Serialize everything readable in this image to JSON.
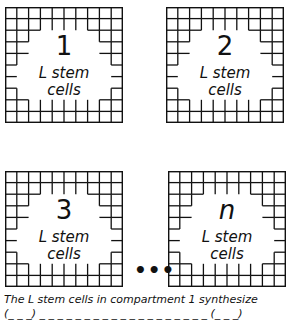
{
  "diagram": {
    "compartments": [
      {
        "number": "1",
        "line1": "L stem",
        "line2": "cells"
      },
      {
        "number": "2",
        "line1": "L stem",
        "line2": "cells"
      },
      {
        "number": "3",
        "line1": "L stem",
        "line2": "cells"
      },
      {
        "number": "n",
        "line1": "L stem",
        "line2": "cells"
      }
    ],
    "ellipsis": "•••",
    "caption_line1": "The L stem cells in compartment 1 synthesize",
    "caption_line2": "(_ _ _)  _ _ _ _ _ _ _ _ _ _ _ _ _ _ _ _ _ _ _ (_ _ _)"
  }
}
